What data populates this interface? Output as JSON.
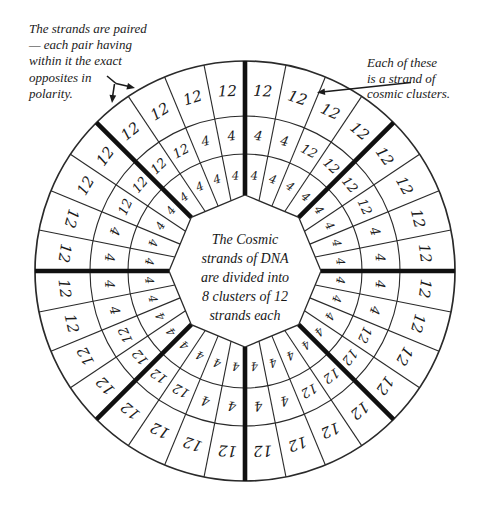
{
  "annotations": {
    "top_left": {
      "lines": [
        "The strands are paired",
        "— each pair having",
        "within it the exact",
        "opposites in",
        "polarity."
      ]
    },
    "top_right": {
      "lines": [
        "Each of these",
        "is a strand of",
        "cosmic clusters."
      ]
    },
    "center": {
      "lines": [
        "The Cosmic",
        "strands of DNA",
        "are divided into",
        "8 clusters of 12",
        "strands each"
      ]
    }
  },
  "chart_data": {
    "type": "radial-grid",
    "title": "The Cosmic strands of DNA are divided into 8 clusters of 12 strands each",
    "clusters_count": 8,
    "strands_per_cluster": 12,
    "columns_per_cluster": 4,
    "rings": [
      "inner",
      "middle",
      "outer"
    ],
    "divider_angles_deg": [
      0,
      45,
      90,
      135,
      180,
      225,
      270,
      315
    ],
    "clusters": [
      {
        "sector": "N-NE",
        "outer": [
          "12",
          "12",
          "12",
          "12"
        ],
        "middle": [
          "4",
          "4",
          "12",
          "12"
        ],
        "inner": [
          "4",
          "4",
          "4",
          "4"
        ]
      },
      {
        "sector": "NE-E",
        "outer": [
          "12",
          "12",
          "12",
          "12"
        ],
        "middle": [
          "12",
          "12",
          "4",
          "4"
        ],
        "inner": [
          "4",
          "4",
          "4",
          "4"
        ]
      },
      {
        "sector": "E-SE",
        "outer": [
          "12",
          "12",
          "12",
          "12"
        ],
        "middle": [
          "4",
          "4",
          "12",
          "12"
        ],
        "inner": [
          "4",
          "4",
          "4",
          "4"
        ]
      },
      {
        "sector": "SE-S",
        "outer": [
          "12",
          "12",
          "12",
          "12"
        ],
        "middle": [
          "12",
          "12",
          "4",
          "4"
        ],
        "inner": [
          "4",
          "4",
          "4",
          "4"
        ]
      },
      {
        "sector": "S-SW",
        "outer": [
          "12",
          "12",
          "12",
          "12"
        ],
        "middle": [
          "4",
          "4",
          "12",
          "12"
        ],
        "inner": [
          "4",
          "4",
          "4",
          "4"
        ]
      },
      {
        "sector": "SW-W",
        "outer": [
          "12",
          "12",
          "12",
          "12"
        ],
        "middle": [
          "12",
          "12",
          "4",
          "4"
        ],
        "inner": [
          "4",
          "4",
          "4",
          "4"
        ]
      },
      {
        "sector": "W-NW",
        "outer": [
          "12",
          "12",
          "12",
          "12"
        ],
        "middle": [
          "4",
          "4",
          "12",
          "12"
        ],
        "inner": [
          "4",
          "4",
          "4",
          "4"
        ]
      },
      {
        "sector": "NW-N",
        "outer": [
          "12",
          "12",
          "12",
          "12"
        ],
        "middle": [
          "12",
          "12",
          "4",
          "4"
        ],
        "inner": [
          "4",
          "4",
          "4",
          "4"
        ]
      }
    ]
  },
  "colors": {
    "ink": "#1b1b1b",
    "line": "#2a2a2a",
    "thick_divider": "#101010",
    "background": "#ffffff"
  }
}
